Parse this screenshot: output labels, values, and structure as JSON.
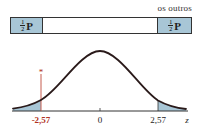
{
  "header": {
    "caption": "os outros"
  },
  "bar": {
    "left_tail": {
      "fraction_num": "1",
      "fraction_den": "2",
      "symbol": "P"
    },
    "right_tail": {
      "fraction_num": "1",
      "fraction_den": "2",
      "symbol": "P"
    }
  },
  "axis": {
    "labels": [
      {
        "text": "-2,57",
        "value": -2.57,
        "highlight": true
      },
      {
        "text": "0",
        "value": 0,
        "highlight": false
      },
      {
        "text": "2,57",
        "value": 2.57,
        "highlight": false
      }
    ],
    "variable": "z"
  },
  "marker": {
    "symbol": "*",
    "at": -2.57
  },
  "colors": {
    "shade": "#a8c6d6",
    "curve": "#2a1a1a",
    "highlight": "#b03020",
    "axis": "#333333"
  }
}
